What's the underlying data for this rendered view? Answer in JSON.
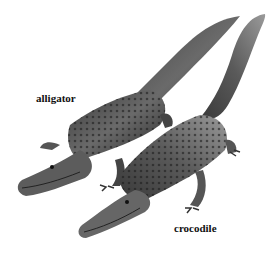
{
  "labels": {
    "alligator": "alligator",
    "crocodile": "crocodile"
  },
  "illustration": {
    "subjects": [
      "alligator",
      "crocodile"
    ],
    "style": "grayscale illustration"
  }
}
